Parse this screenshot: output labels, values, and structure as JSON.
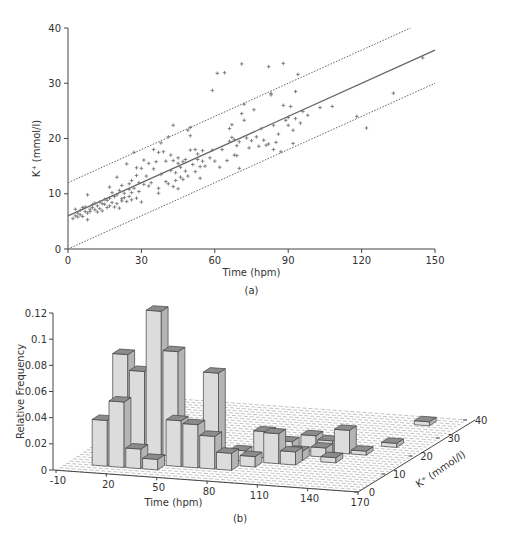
{
  "chart_data": [
    {
      "panel_label": "(a)",
      "type": "scatter",
      "title": "",
      "xlabel": "Time (hpm)",
      "ylabel": "K⁺ (mmol/l)",
      "xlim": [
        0,
        150
      ],
      "ylim": [
        0,
        40
      ],
      "xticks": [
        0,
        30,
        60,
        90,
        120,
        150
      ],
      "yticks": [
        0,
        10,
        20,
        30,
        40
      ],
      "grid": false,
      "marker": "+",
      "series": [
        {
          "name": "observations",
          "points": [
            [
              2,
              5.5
            ],
            [
              3,
              6
            ],
            [
              3,
              7.2
            ],
            [
              4,
              6.5
            ],
            [
              4,
              5.8
            ],
            [
              5,
              7
            ],
            [
              5,
              6.2
            ],
            [
              6,
              7.5
            ],
            [
              6,
              5.9
            ],
            [
              7,
              6.8
            ],
            [
              7,
              7.6
            ],
            [
              8,
              5.3
            ],
            [
              8,
              9.8
            ],
            [
              8,
              6.5
            ],
            [
              9,
              7.2
            ],
            [
              9,
              6.8
            ],
            [
              10,
              7.5
            ],
            [
              10,
              8
            ],
            [
              11,
              7.1
            ],
            [
              11,
              8.3
            ],
            [
              12,
              6.7
            ],
            [
              12,
              7.8
            ],
            [
              13,
              8.5
            ],
            [
              13,
              7.3
            ],
            [
              14,
              8.2
            ],
            [
              14,
              6.9
            ],
            [
              15,
              9
            ],
            [
              15,
              8.1
            ],
            [
              16,
              7.5
            ],
            [
              16,
              8.8
            ],
            [
              17,
              11.2
            ],
            [
              17,
              9.2
            ],
            [
              17,
              7.8
            ],
            [
              18,
              8.4
            ],
            [
              18,
              10.2
            ],
            [
              19,
              9.5
            ],
            [
              19,
              7.6
            ],
            [
              20,
              8.2
            ],
            [
              20,
              9.8
            ],
            [
              20,
              13
            ],
            [
              21,
              7.4
            ],
            [
              21,
              10.6
            ],
            [
              22,
              9.1
            ],
            [
              22,
              8.7
            ],
            [
              22,
              11.5
            ],
            [
              23,
              10.1
            ],
            [
              23,
              9.3
            ],
            [
              24,
              8.6
            ],
            [
              24,
              15.4
            ],
            [
              25,
              10.8
            ],
            [
              25,
              9.5
            ],
            [
              25,
              11.8
            ],
            [
              26,
              8.9
            ],
            [
              26,
              12.4
            ],
            [
              26,
              10.2
            ],
            [
              27,
              17.5
            ],
            [
              27,
              11
            ],
            [
              28,
              9.2
            ],
            [
              28,
              14.7
            ],
            [
              28,
              13.3
            ],
            [
              29,
              10.4
            ],
            [
              29,
              12
            ],
            [
              30,
              8.5
            ],
            [
              30,
              14.6
            ],
            [
              31,
              11.7
            ],
            [
              31,
              16.1
            ],
            [
              32,
              13.2
            ],
            [
              33,
              15.5
            ],
            [
              33,
              11.4
            ],
            [
              34,
              12
            ],
            [
              35,
              18
            ],
            [
              35,
              14.5
            ],
            [
              36,
              15.8
            ],
            [
              37,
              17.5
            ],
            [
              37,
              11
            ],
            [
              37,
              10.1
            ],
            [
              38,
              13.5
            ],
            [
              38,
              19.2
            ],
            [
              39,
              17.6
            ],
            [
              40,
              12.2
            ],
            [
              40,
              15.9
            ],
            [
              41,
              11.8
            ],
            [
              41,
              20.3
            ],
            [
              42,
              17
            ],
            [
              42,
              14.2
            ],
            [
              43,
              22.4
            ],
            [
              43,
              16
            ],
            [
              43,
              11.3
            ],
            [
              44,
              13.8
            ],
            [
              44,
              12.4
            ],
            [
              45,
              15.5
            ],
            [
              45,
              10.9
            ],
            [
              45,
              16.5
            ],
            [
              46,
              14.8
            ],
            [
              46,
              13
            ],
            [
              47,
              15.8
            ],
            [
              47,
              12.6
            ],
            [
              48,
              16.2
            ],
            [
              48,
              14.1
            ],
            [
              49,
              13.2
            ],
            [
              49,
              21.5
            ],
            [
              50,
              17.9
            ],
            [
              50,
              20.5
            ],
            [
              50,
              22
            ],
            [
              51,
              15.3
            ],
            [
              52,
              14
            ],
            [
              52,
              18
            ],
            [
              53,
              16.2
            ],
            [
              53,
              17.2
            ],
            [
              54,
              12.8
            ],
            [
              54,
              14.9
            ],
            [
              55,
              15.9
            ],
            [
              55,
              17.8
            ],
            [
              56,
              15
            ],
            [
              58,
              16.5
            ],
            [
              59,
              28.7
            ],
            [
              59,
              17.9
            ],
            [
              60,
              15.9
            ],
            [
              61,
              31.8
            ],
            [
              62,
              14.8
            ],
            [
              63,
              18
            ],
            [
              64,
              31.9
            ],
            [
              65,
              16
            ],
            [
              66,
              21.8
            ],
            [
              66,
              19.5
            ],
            [
              67,
              22.5
            ],
            [
              67,
              20.2
            ],
            [
              68,
              17
            ],
            [
              68,
              19.8
            ],
            [
              69,
              16.9
            ],
            [
              69,
              18.7
            ],
            [
              70,
              14.6
            ],
            [
              70,
              19.4
            ],
            [
              71,
              33.5
            ],
            [
              71,
              24.5
            ],
            [
              72,
              23.3
            ],
            [
              72,
              26.2
            ],
            [
              73,
              20.1
            ],
            [
              74,
              18.3
            ],
            [
              75,
              19.6
            ],
            [
              76,
              25.2
            ],
            [
              77,
              20.3
            ],
            [
              78,
              18.6
            ],
            [
              79,
              21.8
            ],
            [
              80,
              19.7
            ],
            [
              81,
              18.8
            ],
            [
              82,
              33
            ],
            [
              82,
              19
            ],
            [
              83,
              28.2
            ],
            [
              83,
              27.9
            ],
            [
              84,
              22.4
            ],
            [
              84,
              18
            ],
            [
              85,
              19.3
            ],
            [
              86,
              20.8
            ],
            [
              87,
              17.6
            ],
            [
              88,
              33.6
            ],
            [
              88,
              26
            ],
            [
              89,
              23.3
            ],
            [
              90,
              23.8
            ],
            [
              90,
              22.4
            ],
            [
              91,
              25.8
            ],
            [
              92,
              21.5
            ],
            [
              92,
              19.1
            ],
            [
              93,
              23.6
            ],
            [
              93,
              28.5
            ],
            [
              94,
              31.6
            ],
            [
              95,
              22.8
            ],
            [
              96,
              24.9
            ],
            [
              98,
              24.2
            ],
            [
              103,
              25.6
            ],
            [
              108,
              25.8
            ],
            [
              118,
              24
            ],
            [
              122,
              21.9
            ],
            [
              133,
              28.2
            ],
            [
              145,
              34.6
            ]
          ]
        }
      ],
      "lines": [
        {
          "name": "regression",
          "style": "solid",
          "x": [
            0,
            150
          ],
          "y": [
            6,
            36
          ]
        },
        {
          "name": "upper bound",
          "style": "dotted",
          "x": [
            0,
            140
          ],
          "y": [
            12,
            40
          ]
        },
        {
          "name": "lower bound",
          "style": "dotted",
          "x": [
            0,
            150
          ],
          "y": [
            0,
            30
          ]
        }
      ]
    },
    {
      "panel_label": "(b)",
      "type": "bar3d",
      "title": "",
      "xlabel": "Time (hpm)",
      "ylabel": "K⁺ (mmol/l)",
      "zlabel": "Relative Frequency",
      "xlim": [
        -10,
        170
      ],
      "ylim": [
        0,
        40
      ],
      "zlim": [
        0,
        0.12
      ],
      "xticks": [
        -10,
        20,
        50,
        80,
        110,
        140,
        170
      ],
      "yticks": [
        0,
        10,
        20,
        30,
        40
      ],
      "zticks": [
        0,
        0.02,
        0.04,
        0.06,
        0.08,
        0.1,
        0.12
      ],
      "zticklabels": [
        "0",
        "0.02",
        "0.04",
        "0.06",
        "0.08",
        "0.1",
        "0.12"
      ],
      "grid": "floor dashed",
      "bars": [
        {
          "t": 10,
          "k": 12.5,
          "freq": 0.075
        },
        {
          "t": 20,
          "k": 12.5,
          "freq": 0.063
        },
        {
          "t": 30,
          "k": 12.5,
          "freq": 0.11
        },
        {
          "t": 40,
          "k": 12.5,
          "freq": 0.08
        },
        {
          "t": 60,
          "k": 15,
          "freq": 0.062
        },
        {
          "t": 10,
          "k": 5,
          "freq": 0.035
        },
        {
          "t": 20,
          "k": 5,
          "freq": 0.05
        },
        {
          "t": 30,
          "k": 5,
          "freq": 0.015
        },
        {
          "t": 40,
          "k": 5,
          "freq": 0.008
        },
        {
          "t": 50,
          "k": 7.5,
          "freq": 0.035
        },
        {
          "t": 60,
          "k": 7.5,
          "freq": 0.033
        },
        {
          "t": 70,
          "k": 7.5,
          "freq": 0.025
        },
        {
          "t": 80,
          "k": 7.5,
          "freq": 0.013
        },
        {
          "t": 80,
          "k": 12.5,
          "freq": 0.008
        },
        {
          "t": 90,
          "k": 10,
          "freq": 0.008
        },
        {
          "t": 90,
          "k": 15,
          "freq": 0.02
        },
        {
          "t": 100,
          "k": 12.5,
          "freq": 0.023
        },
        {
          "t": 100,
          "k": 17.5,
          "freq": 0.01
        },
        {
          "t": 110,
          "k": 12.5,
          "freq": 0.01
        },
        {
          "t": 110,
          "k": 15,
          "freq": 0.007
        },
        {
          "t": 110,
          "k": 20,
          "freq": 0.012
        },
        {
          "t": 120,
          "k": 17.5,
          "freq": 0.007
        },
        {
          "t": 120,
          "k": 20,
          "freq": 0.009
        },
        {
          "t": 130,
          "k": 20,
          "freq": 0.018
        },
        {
          "t": 130,
          "k": 15,
          "freq": 0.004
        },
        {
          "t": 140,
          "k": 20,
          "freq": 0.003
        },
        {
          "t": 150,
          "k": 25,
          "freq": 0.003
        },
        {
          "t": 150,
          "k": 37,
          "freq": 0.003
        }
      ]
    }
  ]
}
